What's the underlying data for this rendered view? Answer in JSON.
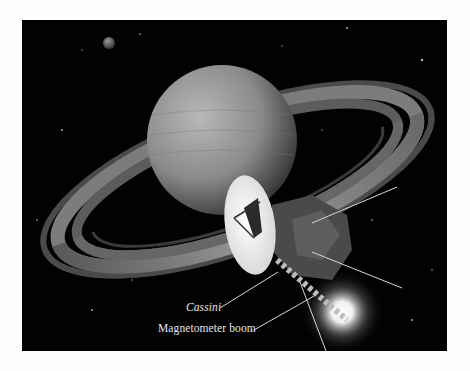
{
  "figure": {
    "labels": [
      {
        "id": "cassini",
        "text": "Cassini"
      },
      {
        "id": "boom",
        "text": "Magnetometer boom"
      }
    ],
    "colors": {
      "background": "#020202",
      "page": "#fdfdfd",
      "label_text": "#e6e6e6",
      "leader_line": "#d8d8d8"
    }
  }
}
